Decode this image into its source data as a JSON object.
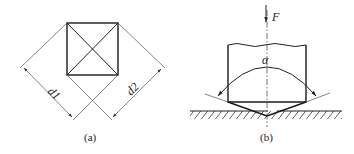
{
  "figure": {
    "panel_a": {
      "caption": "(a)",
      "description": "Square indentation with diagonals, measured diagonals d1 and d2",
      "dimension_labels": [
        "d1",
        "d2"
      ]
    },
    "panel_b": {
      "caption": "(b)",
      "description": "Pyramid indenter pressed into surface by force F with apex angle alpha",
      "force_label": "F",
      "angle_label": "α"
    }
  }
}
